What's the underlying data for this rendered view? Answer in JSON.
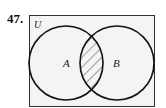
{
  "problem": {
    "number": "47."
  },
  "diagram": {
    "universe_label": "U",
    "set_a_label": "A",
    "set_b_label": "B",
    "shaded_region": "A ∩ B",
    "background": "#f4f4f4",
    "stroke": "#111111"
  }
}
